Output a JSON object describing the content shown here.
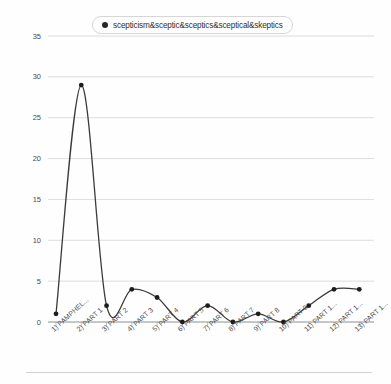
{
  "legend": {
    "label": "scepticism&sceptic&sceptics&sceptical&skeptics",
    "marker": "filled-circle-icon",
    "position": "top-center"
  },
  "axes": {
    "ylabel": "Raw Frequencies",
    "xlabel": ""
  },
  "colors": {
    "line": "#3b3b3b",
    "marker": "#1d1d1d",
    "grid": "#cfcfcf",
    "axis": "#8d8d8d",
    "background": "#fefefe"
  },
  "chart_data": {
    "type": "line",
    "title": "",
    "xlabel": "",
    "ylabel": "Raw Frequencies",
    "ylim": [
      0,
      35
    ],
    "yticks": [
      0,
      5,
      10,
      15,
      20,
      25,
      30,
      35
    ],
    "grid": true,
    "legend_position": "top-center",
    "categories": [
      "1) PAMPHEL...",
      "2) PART 1",
      "3) PART 2",
      "4) PART 3",
      "5) PART 4",
      "6) PART 5",
      "7) PART 6",
      "8) PART 7",
      "9) PART 8",
      "10) PART 9",
      "11) PART 1...",
      "12) PART 1...",
      "13) PART 1..."
    ],
    "series": [
      {
        "name": "scepticism&sceptic&sceptics&sceptical&skeptics",
        "values": [
          1,
          29,
          2,
          4,
          3,
          0,
          2,
          0,
          1,
          0,
          2,
          4,
          4
        ]
      }
    ]
  }
}
